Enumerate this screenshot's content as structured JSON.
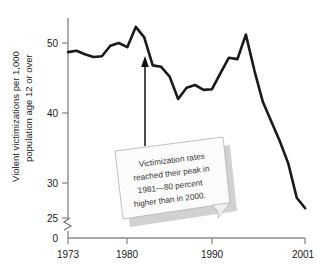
{
  "chart_data": {
    "type": "line",
    "title": "",
    "xlabel": "",
    "ylabel": "Violent victimizations per 1,000 population age 12 or over",
    "ylabel_line1": "Violent victimizations per 1,000",
    "ylabel_line2": "population age 12 or over",
    "xlim": [
      1973,
      2001
    ],
    "ylim": [
      25,
      53
    ],
    "y_axis_break": true,
    "y_break_between": [
      0,
      25
    ],
    "yticks": [
      0,
      25,
      30,
      40,
      50
    ],
    "ytick_labels": [
      "0",
      "25",
      "30",
      "40",
      "50"
    ],
    "xticks": [
      1973,
      1980,
      1990,
      2001
    ],
    "xtick_labels": [
      "1973",
      "1980",
      "1990",
      "2001"
    ],
    "grid": false,
    "legend": "none",
    "line_color": "#1a1a1a",
    "x": [
      1973,
      1974,
      1975,
      1976,
      1977,
      1978,
      1979,
      1980,
      1981,
      1982,
      1983,
      1984,
      1985,
      1986,
      1987,
      1988,
      1989,
      1990,
      1991,
      1992,
      1993,
      1994,
      1995,
      1996,
      1997,
      1998,
      1999,
      2000,
      2001
    ],
    "values": [
      48.7,
      48.9,
      48.4,
      48.0,
      48.1,
      49.6,
      50.0,
      49.4,
      52.3,
      50.8,
      46.8,
      46.6,
      45.2,
      42.0,
      43.6,
      44.0,
      43.3,
      43.4,
      45.7,
      47.9,
      47.7,
      51.2,
      46.1,
      41.6,
      38.8,
      36.0,
      32.8,
      27.9,
      26.4
    ],
    "annotation": {
      "text": "Victimization rates reached their peak in 1981—80 percent higher than in 2000.",
      "lines": [
        "Victimization rates",
        "reached their peak in",
        "1981—80 percent",
        "higher than in 2000."
      ],
      "points_to_year": 1982,
      "arrow": true
    }
  }
}
